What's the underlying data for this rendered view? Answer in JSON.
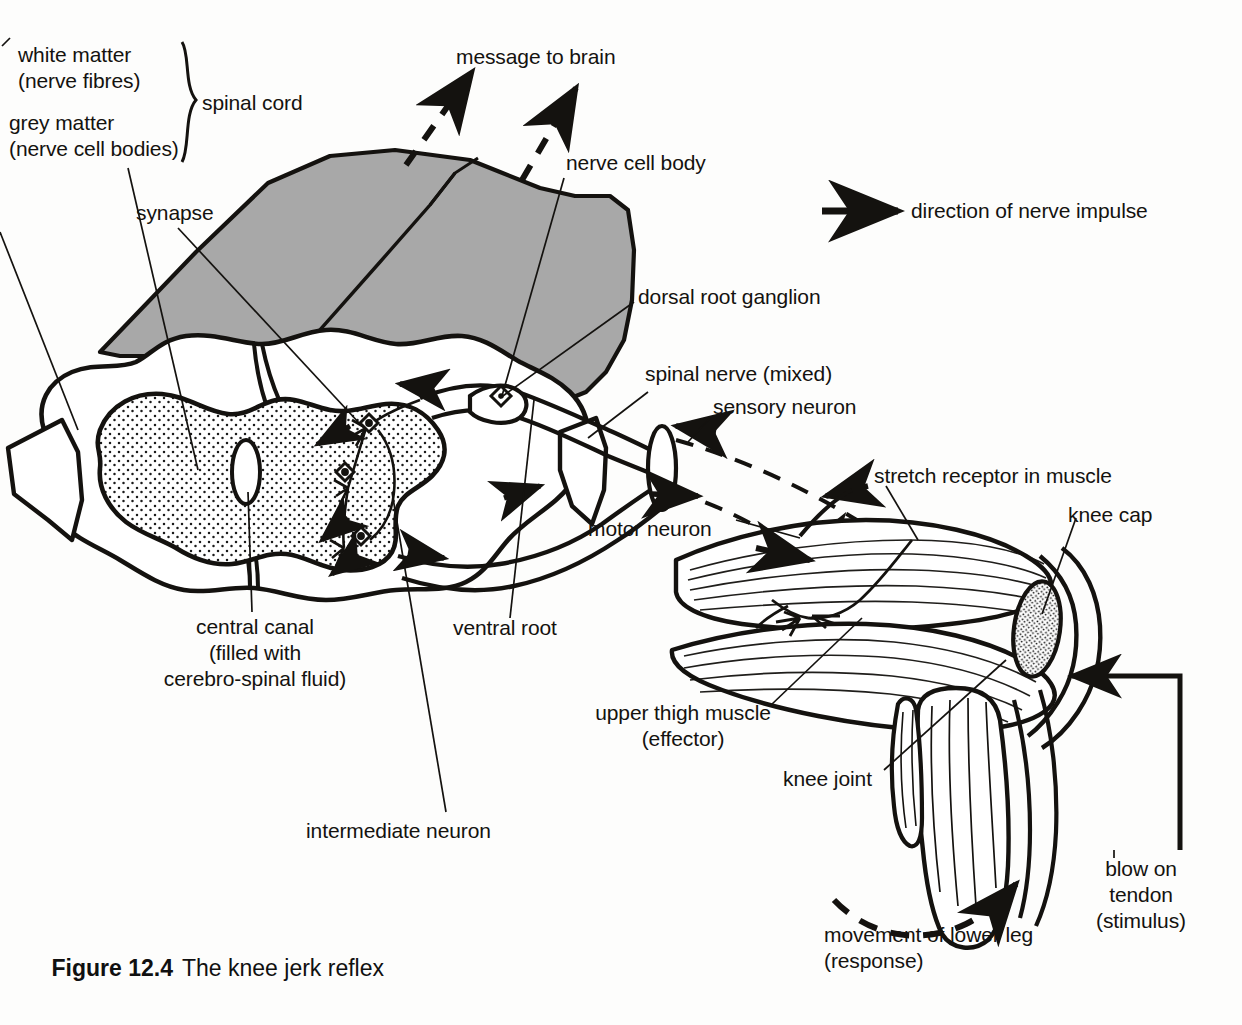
{
  "figure": {
    "number": "Figure 12.4",
    "title": "The knee jerk reflex"
  },
  "legend": {
    "arrow_icon": "solid-arrow-right-icon",
    "label": "direction of nerve impulse"
  },
  "brace_group": {
    "items": [
      "white matter",
      "(nerve fibres)",
      "grey matter",
      "(nerve cell bodies)"
    ],
    "brace_label": "spinal cord"
  },
  "labels": {
    "white_matter_l1": "white matter",
    "white_matter_l2": "(nerve fibres)",
    "grey_matter_l1": "grey matter",
    "grey_matter_l2": "(nerve cell bodies)",
    "spinal_cord": "spinal cord",
    "message_to_brain": "message to brain",
    "nerve_cell_body": "nerve cell body",
    "synapse": "synapse",
    "dorsal_root_ganglion": "dorsal root ganglion",
    "spinal_nerve_mixed": "spinal nerve (mixed)",
    "sensory_neuron": "sensory neuron",
    "stretch_receptor": "stretch receptor in muscle",
    "knee_cap": "knee cap",
    "motor_neuron": "motor neuron",
    "central_canal_l1": "central canal",
    "central_canal_l2": "(filled with",
    "central_canal_l3": "cerebro-spinal fluid)",
    "ventral_root": "ventral root",
    "upper_thigh_muscle_l1": "upper thigh muscle",
    "upper_thigh_muscle_l2": "(effector)",
    "knee_joint": "knee joint",
    "intermediate_neuron": "intermediate neuron",
    "blow_on_tendon_l1": "blow on",
    "blow_on_tendon_l2": "tendon",
    "blow_on_tendon_l3": "(stimulus)",
    "movement_lower_leg_l1": "movement of lower leg",
    "movement_lower_leg_l2": "(response)"
  },
  "colors": {
    "ink": "#14120f",
    "grey_matter_fill": "#ffffff",
    "spinal_cord_3d_fill": "#a8a8a8",
    "page_background": "#fdfdfc",
    "stipple": "#1a1a1a"
  },
  "diagram": {
    "type": "anatomical-line-diagram",
    "components": [
      "spinal cord cross-section",
      "grey matter butterfly (stippled)",
      "white matter outline",
      "central canal",
      "dorsal root ganglion",
      "ventral root",
      "spinal nerve (mixed)",
      "sensory neuron",
      "intermediate neuron",
      "motor neuron",
      "synapse",
      "upper thigh muscle",
      "stretch receptor",
      "knee cap",
      "knee joint",
      "lower leg bones"
    ],
    "arrows": {
      "solid": "direction of nerve impulse",
      "dashed_up": "message to brain",
      "dashed_curve": "movement of lower leg"
    }
  }
}
